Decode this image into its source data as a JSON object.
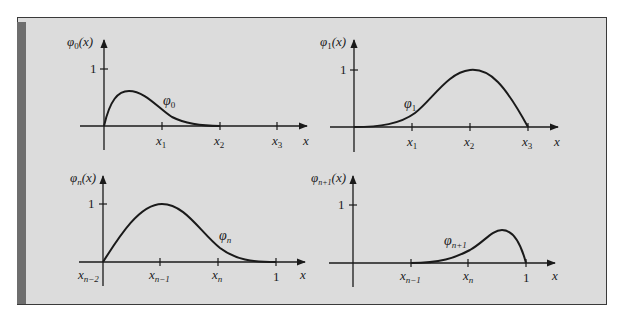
{
  "figure": {
    "background": "#dcdcdc",
    "frame_color": "#3a3a3a",
    "shade_color": "#6e6e6e",
    "line_color": "#1a1a1a"
  },
  "panels": [
    {
      "id": "phi0",
      "y_label_func": "φ",
      "y_label_sub": "0",
      "y_label_arg": "(x)",
      "y_tick_label": "1",
      "x_axis_label": "x",
      "x_ticks": [
        {
          "base": "x",
          "sub": "1"
        },
        {
          "base": "x",
          "sub": "2"
        },
        {
          "base": "x",
          "sub": "3"
        }
      ],
      "curve_label_func": "φ",
      "curve_label_sub": "0"
    },
    {
      "id": "phi1",
      "y_label_func": "φ",
      "y_label_sub": "1",
      "y_label_arg": "(x)",
      "y_tick_label": "1",
      "x_axis_label": "x",
      "x_ticks": [
        {
          "base": "x",
          "sub": "1"
        },
        {
          "base": "x",
          "sub": "2"
        },
        {
          "base": "x",
          "sub": "3"
        }
      ],
      "curve_label_func": "φ",
      "curve_label_sub": "1"
    },
    {
      "id": "phin",
      "y_label_func": "φ",
      "y_label_sub": "n",
      "y_label_arg": "(x)",
      "y_tick_label": "1",
      "x_axis_label": "x",
      "origin_label": {
        "base": "x",
        "sub": "n−2"
      },
      "x_ticks": [
        {
          "base": "x",
          "sub": "n−1"
        },
        {
          "base": "x",
          "sub": "n"
        },
        {
          "base": "1",
          "sub": ""
        }
      ],
      "curve_label_func": "φ",
      "curve_label_sub": "n"
    },
    {
      "id": "phin1",
      "y_label_func": "φ",
      "y_label_sub": "n+1",
      "y_label_arg": "(x)",
      "y_tick_label": "1",
      "x_axis_label": "x",
      "x_ticks": [
        {
          "base": "x",
          "sub": "n−1"
        },
        {
          "base": "x",
          "sub": "n"
        },
        {
          "base": "1",
          "sub": ""
        }
      ],
      "curve_label_func": "φ",
      "curve_label_sub": "n+1"
    }
  ]
}
